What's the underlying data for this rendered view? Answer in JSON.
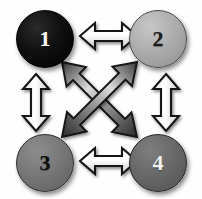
{
  "diagram": {
    "background_color": "#fefefe",
    "nodes": [
      {
        "id": "node-1",
        "label": "1",
        "position": "top-left",
        "fill_color": "#000000",
        "text_color": "#ffffff"
      },
      {
        "id": "node-2",
        "label": "2",
        "position": "top-right",
        "fill_color": "#a8a8a8",
        "text_color": "#1a1a1a"
      },
      {
        "id": "node-3",
        "label": "3",
        "position": "bottom-left",
        "fill_color": "#737373",
        "text_color": "#0d0d0d"
      },
      {
        "id": "node-4",
        "label": "4",
        "position": "bottom-right",
        "fill_color": "#646464",
        "text_color": "#f2f2f2"
      }
    ],
    "connectors": [
      {
        "id": "arrow-top-horizontal",
        "from": "1",
        "to": "2",
        "style": "double-headed",
        "orientation": "horizontal",
        "fill": "outline-light"
      },
      {
        "id": "arrow-bottom-horizontal",
        "from": "3",
        "to": "4",
        "style": "double-headed",
        "orientation": "horizontal",
        "fill": "outline-light"
      },
      {
        "id": "arrow-left-vertical",
        "from": "1",
        "to": "3",
        "style": "double-headed",
        "orientation": "vertical",
        "fill": "outline-light"
      },
      {
        "id": "arrow-right-vertical",
        "from": "2",
        "to": "4",
        "style": "double-headed",
        "orientation": "vertical",
        "fill": "outline-light"
      },
      {
        "id": "arrow-diagonal-nw-se",
        "from": "1",
        "to": "4",
        "style": "double-headed",
        "orientation": "diagonal",
        "fill": "solid-gradient"
      },
      {
        "id": "arrow-diagonal-ne-sw",
        "from": "2",
        "to": "3",
        "style": "double-headed",
        "orientation": "diagonal",
        "fill": "solid-gradient"
      }
    ]
  }
}
